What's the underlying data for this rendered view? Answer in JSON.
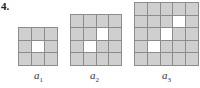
{
  "problem_number": "4.",
  "figures": [
    {
      "label": "a",
      "subscript": "1",
      "size": 3,
      "white_cells": [
        [
          1,
          1
        ]
      ]
    },
    {
      "label": "a",
      "subscript": "2",
      "size": 4,
      "white_cells": [
        [
          1,
          2
        ],
        [
          2,
          1
        ]
      ]
    },
    {
      "label": "a",
      "subscript": "3",
      "size": 5,
      "white_cells": [
        [
          1,
          3
        ],
        [
          2,
          2
        ],
        [
          3,
          1
        ]
      ]
    }
  ],
  "colors": {
    "shaded": "#cfcfcf",
    "white": "#ffffff",
    "gridline": "#8c8c8c"
  }
}
